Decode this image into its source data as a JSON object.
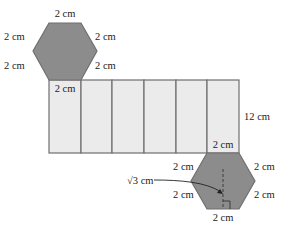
{
  "diagram": {
    "type": "hexagonal-prism-net",
    "colors": {
      "hexagon_fill": "#8c8c8c",
      "face_fill": "#ebebeb",
      "stroke": "#6f6f6f",
      "text": "#222222"
    },
    "top_hexagon": {
      "labels": {
        "top": "2 cm",
        "upper_left": "2 cm",
        "upper_right": "2 cm",
        "lower_left": "2 cm",
        "lower_right": "2 cm"
      }
    },
    "lateral_faces": {
      "count": 6,
      "first_face_label": "2 cm",
      "last_face_label": "2 cm",
      "height_label": "12 cm"
    },
    "bottom_hexagon": {
      "labels": {
        "upper_left": "2 cm",
        "upper_right": "2 cm",
        "lower_left": "2 cm",
        "lower_right": "2 cm",
        "bottom": "2 cm",
        "apothem": "√3 cm"
      }
    }
  }
}
